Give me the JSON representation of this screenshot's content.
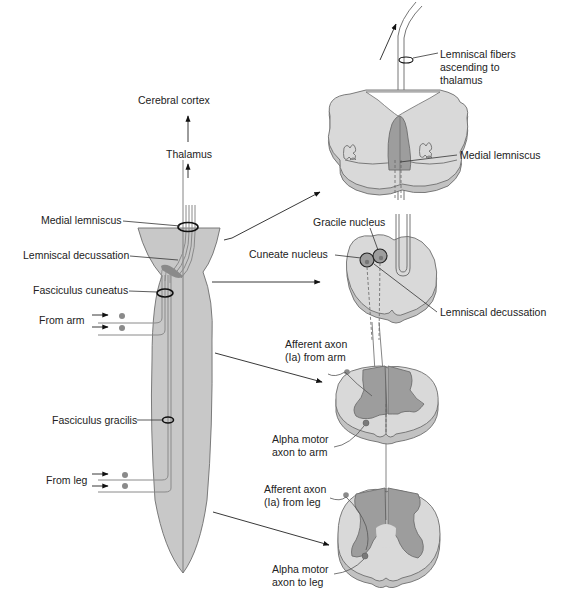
{
  "diagram": {
    "colors": {
      "tissue_light": "#d9d9d9",
      "tissue_side": "#c2c2c2",
      "tissue_dark": "#9d9d9d",
      "outline": "#6e6e6e",
      "text": "#222222"
    },
    "left_panel": {
      "labels": {
        "cerebral_cortex": "Cerebral cortex",
        "thalamus": "Thalamus",
        "medial_lemniscus": "Medial lemniscus",
        "lemniscal_decussation": "Lemniscal decussation",
        "fasciculus_cuneatus": "Fasciculus cuneatus",
        "from_arm": "From arm",
        "fasciculus_gracilis": "Fasciculus gracilis",
        "from_leg": "From leg"
      }
    },
    "right_panel": {
      "sections": [
        {
          "id": "medulla-upper",
          "labels": {
            "lemniscal_fibers_line1": "Lemniscal fibers",
            "lemniscal_fibers_line2": "ascending to",
            "lemniscal_fibers_line3": "thalamus",
            "medial_lemniscus": "Medial lemniscus"
          }
        },
        {
          "id": "medulla-lower",
          "labels": {
            "gracile_nucleus": "Gracile nucleus",
            "cuneate_nucleus": "Cuneate nucleus",
            "lemniscal_decussation": "Lemniscal decussation"
          }
        },
        {
          "id": "cervical-cord",
          "labels": {
            "afferent_line1": "Afferent axon",
            "afferent_line2": "(Ia) from arm",
            "motor_line1": "Alpha motor",
            "motor_line2": "axon to arm"
          }
        },
        {
          "id": "lumbar-cord",
          "labels": {
            "afferent_line1": "Afferent axon",
            "afferent_line2": "(Ia) from leg",
            "motor_line1": "Alpha motor",
            "motor_line2": "axon to leg"
          }
        }
      ]
    }
  }
}
